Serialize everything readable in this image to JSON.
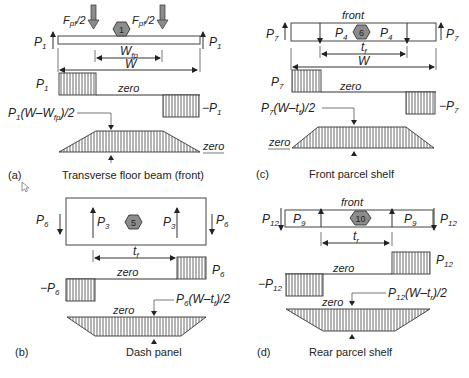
{
  "panels": [
    {
      "id": "a",
      "tag": "(a)",
      "caption": "Transverse floor beam (front)",
      "node": "1",
      "load_left": "F",
      "load_left_sub": "pf",
      "load_left_suffix": "/2",
      "load_right": "F",
      "load_right_sub": "pf",
      "load_right_suffix": "/2",
      "reaction_left": "P",
      "reaction_left_sub": "1",
      "reaction_right": "P",
      "reaction_right_sub": "1",
      "inner_dim": "W",
      "inner_dim_sub": "fp",
      "outer_dim": "W",
      "shear_pos": "P",
      "shear_pos_sub": "1",
      "shear_neg": "−P",
      "shear_neg_sub": "1",
      "shear_zero": "zero",
      "moment_label_a": "P",
      "moment_label_sub": "1",
      "moment_label_b": "(W–W",
      "moment_label_sub2": "fp",
      "moment_label_c": ")/2",
      "moment_zero": "zero"
    },
    {
      "id": "c",
      "tag": "(c)",
      "caption": "Front parcel shelf",
      "node": "6",
      "front": "front",
      "force_left": "P",
      "force_left_sub": "4",
      "force_right": "P",
      "force_right_sub": "4",
      "reaction_left": "P",
      "reaction_left_sub": "7",
      "reaction_right": "P",
      "reaction_right_sub": "7",
      "inner_dim": "t",
      "inner_dim_sub": "f",
      "outer_dim": "W",
      "shear_pos": "P",
      "shear_pos_sub": "7",
      "shear_neg": "−P",
      "shear_neg_sub": "7",
      "shear_zero": "zero",
      "moment_label_a": "P",
      "moment_label_sub": "7",
      "moment_label_b": "(W–t",
      "moment_label_sub2": "f",
      "moment_label_c": ")/2",
      "moment_zero": "zero"
    },
    {
      "id": "b",
      "tag": "(b)",
      "caption": "Dash panel",
      "node": "5",
      "force_left": "P",
      "force_left_sub": "3",
      "force_right": "P",
      "force_right_sub": "3",
      "reaction_left": "P",
      "reaction_left_sub": "6",
      "reaction_right": "P",
      "reaction_right_sub": "6",
      "inner_dim": "t",
      "inner_dim_sub": "f",
      "shear_pos": "P",
      "shear_pos_sub": "6",
      "shear_neg": "−P",
      "shear_neg_sub": "6",
      "shear_zero": "zero",
      "moment_label_a": "P",
      "moment_label_sub": "6",
      "moment_label_b": "(W–t",
      "moment_label_sub2": "f",
      "moment_label_c": ")/2",
      "moment_zero": "zero"
    },
    {
      "id": "d",
      "tag": "(d)",
      "caption": "Rear parcel shelf",
      "node": "10",
      "front": "front",
      "force_left": "P",
      "force_left_sub": "9",
      "force_right": "P",
      "force_right_sub": "9",
      "reaction_left": "P",
      "reaction_left_sub": "12",
      "reaction_right": "P",
      "reaction_right_sub": "12",
      "inner_dim": "t",
      "inner_dim_sub": "r",
      "shear_pos": "P",
      "shear_pos_sub": "12",
      "shear_neg": "−P",
      "shear_neg_sub": "12",
      "shear_zero": "zero",
      "moment_label_a": "P",
      "moment_label_sub": "12",
      "moment_label_b": "(W–t",
      "moment_label_sub2": "r",
      "moment_label_c": ")/2",
      "moment_zero": "zero"
    }
  ],
  "colors": {
    "node_fill": "#8c8c8c",
    "line": "#333333"
  }
}
